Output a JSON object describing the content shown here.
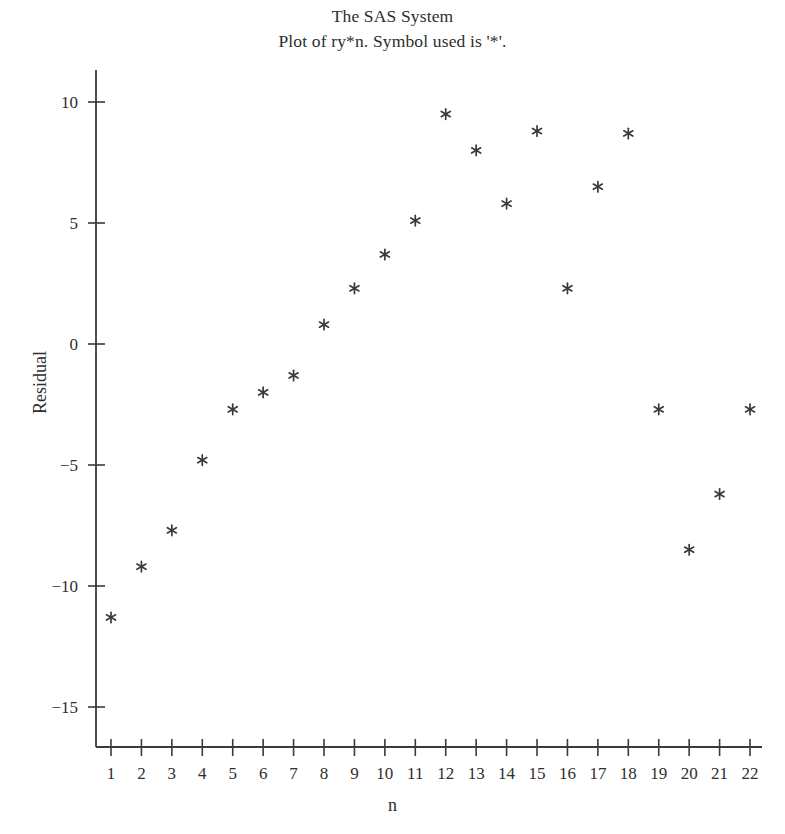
{
  "titles": {
    "line1": "The SAS System",
    "line2": "Plot of ry*n. Symbol used is '*'."
  },
  "axes": {
    "ylabel": "Residual",
    "xlabel": "n"
  },
  "style": {
    "axis_color": "#3a3a3a",
    "marker_color": "#3a3a3a",
    "text_color": "#2e2e2e",
    "background": "#ffffff",
    "marker_symbol": "*"
  },
  "chart_data": {
    "type": "scatter",
    "title": "The SAS System\nPlot of ry*n. Symbol used is '*'.",
    "xlabel": "n",
    "ylabel": "Residual",
    "grid": false,
    "legend": false,
    "marker": "*",
    "xlim": [
      0.4,
      22.6
    ],
    "ylim": [
      -16.5,
      11.5
    ],
    "xticks": [
      1,
      2,
      3,
      4,
      5,
      6,
      7,
      8,
      9,
      10,
      11,
      12,
      13,
      14,
      15,
      16,
      17,
      18,
      19,
      20,
      21,
      22
    ],
    "xticklabels": [
      "1",
      "2",
      "3",
      "4",
      "5",
      "6",
      "7",
      "8",
      "9",
      "10",
      "11",
      "12",
      "13",
      "14",
      "15",
      "16",
      "17",
      "18",
      "19",
      "20",
      "21",
      "22"
    ],
    "yticks": [
      10,
      5,
      0,
      -5,
      -10,
      -15
    ],
    "yticklabels": [
      "10",
      "5",
      "0",
      "-5",
      "-10",
      "-15"
    ],
    "x": [
      1,
      2,
      3,
      4,
      5,
      6,
      7,
      8,
      9,
      10,
      11,
      12,
      13,
      14,
      15,
      16,
      17,
      18,
      19,
      20,
      21,
      22
    ],
    "y": [
      -11.3,
      -9.2,
      -7.7,
      -4.8,
      -2.7,
      -2.0,
      -1.3,
      0.8,
      2.3,
      3.7,
      5.1,
      9.5,
      8.0,
      5.8,
      8.8,
      2.3,
      6.5,
      8.7,
      -2.7,
      -8.5,
      -6.2,
      -2.7
    ],
    "points": [
      {
        "n": 1,
        "residual": -11.3
      },
      {
        "n": 2,
        "residual": -9.2
      },
      {
        "n": 3,
        "residual": -7.7
      },
      {
        "n": 4,
        "residual": -4.8
      },
      {
        "n": 5,
        "residual": -2.7
      },
      {
        "n": 6,
        "residual": -2.0
      },
      {
        "n": 7,
        "residual": -1.3
      },
      {
        "n": 8,
        "residual": 0.8
      },
      {
        "n": 9,
        "residual": 2.3
      },
      {
        "n": 10,
        "residual": 3.7
      },
      {
        "n": 11,
        "residual": 5.1
      },
      {
        "n": 12,
        "residual": 9.5
      },
      {
        "n": 13,
        "residual": 8.0
      },
      {
        "n": 14,
        "residual": 5.8
      },
      {
        "n": 15,
        "residual": 8.8
      },
      {
        "n": 16,
        "residual": 2.3
      },
      {
        "n": 17,
        "residual": 6.5
      },
      {
        "n": 18,
        "residual": 8.7
      },
      {
        "n": 19,
        "residual": -2.7
      },
      {
        "n": 20,
        "residual": -8.5
      },
      {
        "n": 21,
        "residual": -6.2
      },
      {
        "n": 22,
        "residual": -2.7
      }
    ]
  }
}
